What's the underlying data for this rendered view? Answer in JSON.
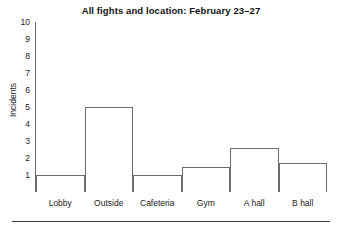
{
  "chart_data": {
    "type": "bar",
    "title": "All fights and location: February 23–27",
    "xlabel": "",
    "ylabel": "Incidents",
    "categories": [
      "Lobby",
      "Outside",
      "Cafeteria",
      "Gym",
      "A hall",
      "B hall"
    ],
    "values": [
      1,
      5,
      1,
      1.45,
      2.6,
      1.7
    ],
    "yticks": [
      10,
      9,
      8,
      7,
      6,
      5,
      4,
      3,
      2,
      1
    ],
    "ylim": [
      0,
      10
    ],
    "grid": false,
    "legend": null,
    "series": [
      {
        "name": "Incidents",
        "values": [
          1,
          5,
          1,
          1.45,
          2.6,
          1.7
        ]
      }
    ],
    "style": {
      "bar_fill": "#ffffff",
      "bar_stroke": "#6b6b6b",
      "axis_color": "#6b6b6b",
      "text_color": "#1a1a1a",
      "background": "#ffffff"
    }
  }
}
